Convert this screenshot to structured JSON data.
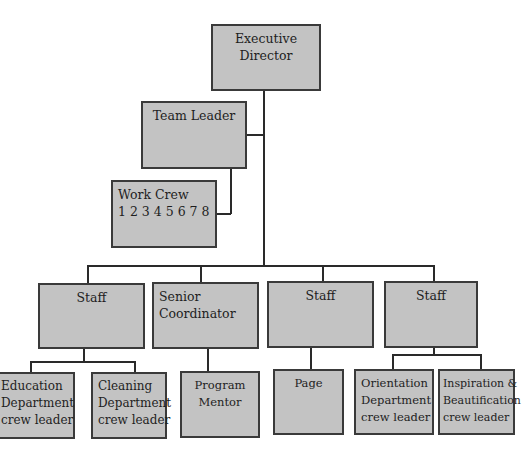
{
  "chart": {
    "type": "org-chart",
    "nodes": {
      "executive_director": {
        "line1": "Executive",
        "line2": "Director"
      },
      "team_leader": {
        "line1": "Team Leader"
      },
      "work_crew": {
        "line1": "Work Crew",
        "line2": "1 2 3 4 5 6 7 8"
      },
      "staff_1": {
        "line1": "Staff"
      },
      "senior_coordinator": {
        "line1": "Senior",
        "line2": "Coordinator"
      },
      "staff_2": {
        "line1": "Staff"
      },
      "staff_3": {
        "line1": "Staff"
      },
      "education": {
        "line1": "Education",
        "line2": "Department",
        "line3": "crew leader"
      },
      "cleaning": {
        "line1": "Cleaning",
        "line2": "Department",
        "line3": "crew leader"
      },
      "program_mentor": {
        "line1": "Program",
        "line2": "Mentor"
      },
      "page": {
        "line1": "Page"
      },
      "orientation": {
        "line1": "Orientation",
        "line2": "Department",
        "line3": "crew leader"
      },
      "inspiration": {
        "line1": "Inspiration &",
        "line2": "Beautification",
        "line3": "crew leader"
      }
    },
    "edges": [
      [
        "executive_director",
        "team_leader"
      ],
      [
        "team_leader",
        "work_crew"
      ],
      [
        "executive_director",
        "staff_1"
      ],
      [
        "executive_director",
        "senior_coordinator"
      ],
      [
        "executive_director",
        "staff_2"
      ],
      [
        "executive_director",
        "staff_3"
      ],
      [
        "staff_1",
        "education"
      ],
      [
        "staff_1",
        "cleaning"
      ],
      [
        "senior_coordinator",
        "program_mentor"
      ],
      [
        "staff_2",
        "page"
      ],
      [
        "staff_3",
        "orientation"
      ],
      [
        "staff_3",
        "inspiration"
      ]
    ],
    "colors": {
      "box_fill": "#c3c3c3",
      "box_border": "#3a3a3a",
      "line": "#2a2a2a"
    }
  }
}
